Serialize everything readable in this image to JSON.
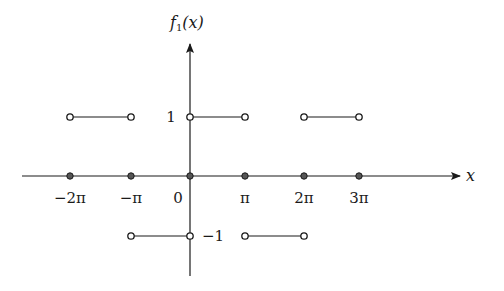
{
  "diagram": {
    "type": "piecewise-step-function-graph",
    "y_axis_label": "f",
    "y_axis_label_sub": "1",
    "y_axis_label_arg": "(x)",
    "x_axis_label": "x",
    "x_tick_labels": [
      "−2π",
      "−π",
      "0",
      "π",
      "2π",
      "3π"
    ],
    "y_tick_labels": {
      "pos": "1",
      "neg": "−1"
    },
    "segments": [
      {
        "from": "−2π",
        "to": "−π",
        "y": 1,
        "endpoints": "open"
      },
      {
        "from": "−π",
        "to": "0",
        "y": -1,
        "endpoints": "open"
      },
      {
        "from": "0",
        "to": "π",
        "y": 1,
        "endpoints": "open"
      },
      {
        "from": "π",
        "to": "2π",
        "y": -1,
        "endpoints": "open"
      },
      {
        "from": "2π",
        "to": "3π",
        "y": 1,
        "endpoints": "open"
      }
    ],
    "points_on_axis": [
      {
        "x": "−2π",
        "y": 0,
        "style": "filled"
      },
      {
        "x": "−π",
        "y": 0,
        "style": "filled"
      },
      {
        "x": "0",
        "y": 0,
        "style": "filled"
      },
      {
        "x": "π",
        "y": 0,
        "style": "filled"
      },
      {
        "x": "2π",
        "y": 0,
        "style": "filled"
      },
      {
        "x": "3π",
        "y": 0,
        "style": "filled"
      }
    ],
    "colors": {
      "ink": "#1a1a1a",
      "background": "#ffffff"
    }
  }
}
